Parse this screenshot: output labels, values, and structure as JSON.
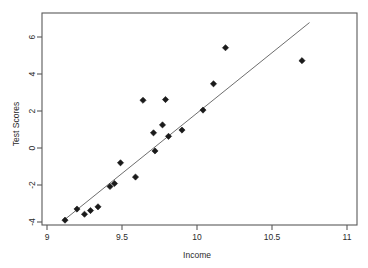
{
  "chart_data": {
    "type": "scatter",
    "title": "",
    "xlabel": "Income",
    "ylabel": "Test Scores",
    "xlim": [
      9,
      11
    ],
    "ylim": [
      -4.6,
      6.9
    ],
    "xticks": [
      9,
      9.5,
      10,
      10.5,
      11
    ],
    "xticklabels": [
      "9",
      "9.5",
      "10",
      "10.5",
      "11"
    ],
    "yticks": [
      6,
      4,
      2,
      0,
      -2,
      -4
    ],
    "yticklabels": [
      "6",
      "4",
      "2",
      "0",
      "-2",
      "-4"
    ],
    "grid": false,
    "legend": null,
    "frame": "box",
    "series": [
      {
        "name": "observations",
        "marker": "diamond",
        "color": "#1a1a1a",
        "points": [
          {
            "x": 9.12,
            "y": -3.9
          },
          {
            "x": 9.2,
            "y": -3.3
          },
          {
            "x": 9.25,
            "y": -3.58
          },
          {
            "x": 9.29,
            "y": -3.38
          },
          {
            "x": 9.34,
            "y": -3.18
          },
          {
            "x": 9.42,
            "y": -2.08
          },
          {
            "x": 9.45,
            "y": -1.92
          },
          {
            "x": 9.49,
            "y": -0.8
          },
          {
            "x": 9.59,
            "y": -1.57
          },
          {
            "x": 9.64,
            "y": 2.58
          },
          {
            "x": 9.71,
            "y": 0.82
          },
          {
            "x": 9.72,
            "y": -0.16
          },
          {
            "x": 9.77,
            "y": 1.25
          },
          {
            "x": 9.79,
            "y": 2.62
          },
          {
            "x": 9.81,
            "y": 0.63
          },
          {
            "x": 9.9,
            "y": 0.97
          },
          {
            "x": 10.04,
            "y": 2.05
          },
          {
            "x": 10.11,
            "y": 3.47
          },
          {
            "x": 10.19,
            "y": 5.42
          },
          {
            "x": 10.7,
            "y": 4.72
          }
        ]
      }
    ],
    "fit_line": {
      "name": "regression-line",
      "color": "#6e6e6e",
      "x_start": 9.11,
      "y_start": -3.92,
      "x_end": 10.75,
      "y_end": 6.78
    }
  }
}
